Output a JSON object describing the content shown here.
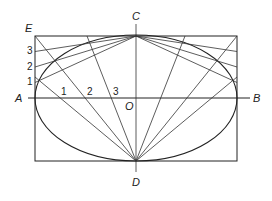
{
  "figure": {
    "labels": {
      "A": "A",
      "B": "B",
      "C": "C",
      "D": "D",
      "E": "E",
      "O": "O"
    },
    "edge_divisions": [
      "1",
      "2",
      "3"
    ],
    "axis_divisions": [
      "1",
      "2",
      "3"
    ]
  },
  "geometry": {
    "rect": {
      "x1": 35,
      "y1": 36,
      "x2": 237,
      "y2": 161
    },
    "center": {
      "x": 136,
      "y": 98
    },
    "major_axis": {
      "x1": 28,
      "x2": 250,
      "y": 98
    },
    "minor_axis": {
      "x": 136,
      "y1": 24,
      "y2": 172
    },
    "stroke_color": "#222222",
    "background": "#ffffff"
  }
}
